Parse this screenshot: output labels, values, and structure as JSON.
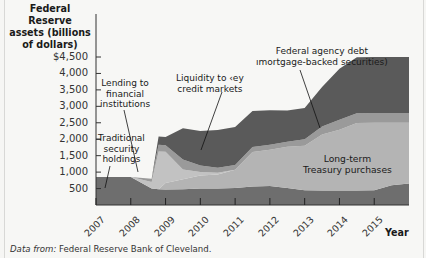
{
  "chart_data": {
    "type": "area",
    "title": "",
    "ylabel": "Federal Reserve assets (billions of dollars)",
    "xlabel": "Year",
    "ylim": [
      0,
      4500
    ],
    "xlim": [
      2007,
      2016
    ],
    "yticks": [
      "500",
      "1,000",
      "1,500",
      "2,000",
      "2,500",
      "3,000",
      "3,500",
      "4,000",
      "$4,500"
    ],
    "xticks": [
      "2007",
      "2008",
      "2009",
      "2010",
      "2011",
      "2012",
      "2013",
      "2014",
      "2015"
    ],
    "stacked": true,
    "grid": false,
    "x": [
      2007.0,
      2008.0,
      2008.6,
      2008.8,
      2009.0,
      2009.5,
      2010.0,
      2010.5,
      2011.0,
      2011.5,
      2012.0,
      2012.5,
      2013.0,
      2013.5,
      2014.0,
      2014.5,
      2015.0,
      2015.5,
      2016.0
    ],
    "series": [
      {
        "name": "Traditional security holdings",
        "color": "#6e6e6e",
        "values": [
          850,
          850,
          500,
          480,
          470,
          480,
          500,
          500,
          520,
          560,
          580,
          520,
          450,
          440,
          440,
          440,
          450,
          600,
          650
        ]
      },
      {
        "name": "Long-term Treasury purchases",
        "color": "#b4b4b4",
        "values": [
          0,
          0,
          0,
          0,
          200,
          300,
          400,
          430,
          550,
          1050,
          1100,
          1250,
          1350,
          1700,
          1850,
          2050,
          2050,
          1900,
          1850
        ]
      },
      {
        "name": "Lending to financial institutions",
        "color": "#c2c2c2",
        "values": [
          0,
          0,
          200,
          1150,
          950,
          300,
          100,
          50,
          0,
          0,
          0,
          0,
          0,
          0,
          0,
          0,
          0,
          0,
          0
        ]
      },
      {
        "name": "Liquidity to key credit markets",
        "color": "#9a9a9a",
        "values": [
          0,
          0,
          100,
          200,
          200,
          300,
          200,
          150,
          150,
          150,
          150,
          150,
          200,
          250,
          300,
          300,
          300,
          300,
          300
        ]
      },
      {
        "name": "Federal agency debt (mortgage-backed securities)",
        "color": "#5a5a5a",
        "values": [
          0,
          0,
          0,
          250,
          250,
          950,
          1050,
          1150,
          1150,
          1100,
          1050,
          950,
          950,
          1200,
          1550,
          1700,
          1700,
          1700,
          1700
        ]
      }
    ],
    "annotations": [
      "Lending to financial institutions",
      "Liquidity to key credit markets",
      "Federal agency debt (mortgage-backed securities)",
      "Traditional security holdings",
      "Long-term Treasury purchases"
    ]
  },
  "labels": {
    "ytitle_line1": "Federal Reserve",
    "ytitle_line2": "assets (billions",
    "ytitle_line3": "of dollars)",
    "year": "Year",
    "source_prefix": "Data from:",
    "source_text": " Federal Reserve Bank of Cleveland.",
    "annot_lending_1": "Lending to",
    "annot_lending_2": "financial",
    "annot_lending_3": "institutions",
    "annot_liquidity_1": "Liquidity to ‹ey",
    "annot_liquidity_2": "credit markets",
    "annot_mbs_1": "Federal agency debt",
    "annot_mbs_2": "ımortgage-backed securities)",
    "annot_trad_1": "Traditional",
    "annot_trad_2": "security",
    "annot_trad_3": "holdings",
    "annot_lt_1": "Long-term",
    "annot_lt_2": "Treasury purchases"
  }
}
